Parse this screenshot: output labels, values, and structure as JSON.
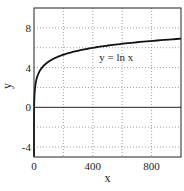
{
  "chart_data": {
    "type": "line",
    "title": "",
    "xlabel": "x",
    "ylabel": "y",
    "xlim": [
      0,
      1000
    ],
    "ylim": [
      -5,
      10
    ],
    "grid": true,
    "grid_style": "dotted",
    "legend": null,
    "x_ticks": [
      0,
      400,
      800
    ],
    "x_tick_labels": [
      "0",
      "400",
      "800"
    ],
    "x_grid": [
      200,
      400,
      600,
      800
    ],
    "y_ticks": [
      -4,
      0,
      4,
      8
    ],
    "y_tick_labels": [
      "-4",
      "0",
      "4",
      "8"
    ],
    "y_grid": [
      -4,
      -2,
      2,
      4,
      6,
      8
    ],
    "reference_lines": [
      {
        "axis": "y",
        "value": 0,
        "style": "solid"
      }
    ],
    "series": [
      {
        "name": "y = ln x",
        "function": "ln(x)",
        "color": "#111111",
        "x": [
          0.007,
          0.05,
          0.2,
          1,
          3,
          10,
          25,
          50,
          100,
          200,
          300,
          400,
          500,
          600,
          700,
          800,
          900,
          1000
        ],
        "y": [
          -4.96,
          -3.0,
          -1.61,
          0,
          1.1,
          2.3,
          3.22,
          3.91,
          4.61,
          5.3,
          5.7,
          5.99,
          6.21,
          6.4,
          6.55,
          6.68,
          6.8,
          6.91
        ]
      }
    ],
    "annotations": [
      {
        "text": "y = ln x",
        "x": 560,
        "y": 5.1
      }
    ]
  },
  "colors": {
    "background": "#ffffff",
    "axes": "#222222",
    "grid": "#888888",
    "curve": "#111111"
  }
}
